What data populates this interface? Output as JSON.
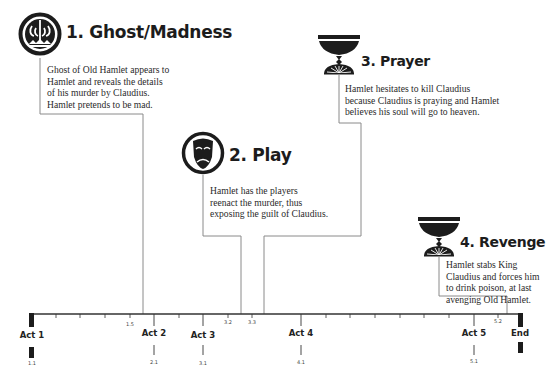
{
  "events": [
    {
      "number": "1.",
      "title": "1. Ghost/Madness",
      "icon": "ghost-crown-icon",
      "lines": [
        "Ghost of Old Hamlet appears to",
        "Hamlet and reveals the details",
        "of his murder by Claudius.",
        "Hamlet pretends to be mad."
      ]
    },
    {
      "number": "2.",
      "title": "2. Play",
      "icon": "theater-mask-icon",
      "lines": [
        "Hamlet has the players",
        "reenact the murder, thus",
        "exposing the guilt of Claudius."
      ]
    },
    {
      "number": "3.",
      "title": "3. Prayer",
      "icon": "chalice-icon",
      "lines": [
        "Hamlet hesitates to kill Claudius",
        "because Claudius is praying and Hamlet",
        "believes his soul will go to heaven."
      ]
    },
    {
      "number": "4.",
      "title": "4. Revenge",
      "icon": "chalice-icon",
      "lines": [
        "Hamlet stabs King",
        "Claudius and forces him",
        "to drink poison, at last",
        "avenging Old Hamlet."
      ]
    }
  ],
  "timeline": {
    "acts": [
      {
        "label": "Act 1",
        "scene": "1.1"
      },
      {
        "label": "Act 2",
        "scene": "2.1"
      },
      {
        "label": "Act 3",
        "scene": "3.1"
      },
      {
        "label": "Act 4",
        "scene": "4.1"
      },
      {
        "label": "Act 5",
        "scene": "5.1"
      },
      {
        "label": "End"
      }
    ],
    "scene_marks": [
      "1.5",
      "3.2",
      "3.3",
      "5.2"
    ]
  },
  "colors": {
    "ink": "#1c1c1c",
    "line": "#8a8a8a",
    "axis": "#333333"
  }
}
